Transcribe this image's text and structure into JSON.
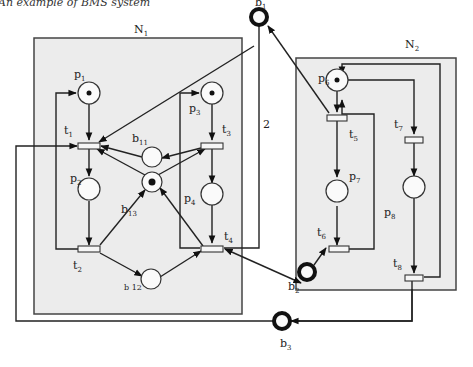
{
  "caption": "An example of BMS system",
  "nets": {
    "n1": {
      "label": "N",
      "sub": "1"
    },
    "n2": {
      "label": "N",
      "sub": "2"
    }
  },
  "places": {
    "p1": {
      "label": "p",
      "sub": "1",
      "tokens": 1
    },
    "p2": {
      "label": "p",
      "sub": "2",
      "tokens": 0
    },
    "p3": {
      "label": "p",
      "sub": "3",
      "tokens": 1
    },
    "p4": {
      "label": "p",
      "sub": "4",
      "tokens": 0
    },
    "p6": {
      "label": "p",
      "sub": "6",
      "tokens": 1
    },
    "p7": {
      "label": "p",
      "sub": "7",
      "tokens": 0
    },
    "p8": {
      "label": "p",
      "sub": "8",
      "tokens": 0
    },
    "b11": {
      "label": "b",
      "sub": "11",
      "tokens": 0
    },
    "b12": {
      "label": "b 12",
      "sub": "",
      "tokens": 0
    },
    "b13": {
      "label": "b",
      "sub": "13",
      "tokens": 1
    },
    "b1": {
      "label": "b",
      "sub": "1",
      "tokens": 0
    },
    "b2": {
      "label": "b",
      "sub": "2",
      "tokens": 0
    },
    "b3": {
      "label": "b",
      "sub": "3",
      "tokens": 0
    }
  },
  "transitions": {
    "t1": {
      "label": "t",
      "sub": "1"
    },
    "t2": {
      "label": "t",
      "sub": "2"
    },
    "t3": {
      "label": "t",
      "sub": "3"
    },
    "t4": {
      "label": "t",
      "sub": "4"
    },
    "t5": {
      "label": "t",
      "sub": "5"
    },
    "t6": {
      "label": "t",
      "sub": "6"
    },
    "t7": {
      "label": "t",
      "sub": "7"
    },
    "t8": {
      "label": "t",
      "sub": "8"
    }
  },
  "arc_weights": {
    "b1_t5": "2"
  }
}
